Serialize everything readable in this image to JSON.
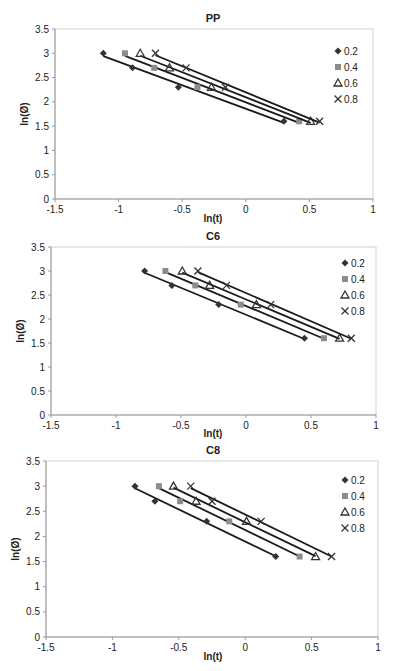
{
  "figure": {
    "width": 395,
    "height": 671
  },
  "chart_data": [
    {
      "type": "scatter",
      "title": "PP",
      "xlabel": "ln(t)",
      "ylabel": "ln(Ø)",
      "xlim": [
        -1.5,
        1
      ],
      "ylim": [
        0,
        3.5
      ],
      "xticks": [
        -1.5,
        -1,
        -0.5,
        0,
        0.5,
        1
      ],
      "yticks": [
        0,
        0.5,
        1,
        1.5,
        2,
        2.5,
        3,
        3.5
      ],
      "xtick_labels": [
        "-1.5",
        "-1",
        "-0.5",
        "0",
        "0.5",
        "1"
      ],
      "ytick_labels": [
        "0",
        "0.5",
        "1",
        "1.5",
        "2",
        "2.5",
        "3",
        "3.5"
      ],
      "grid": false,
      "legend_position": "right",
      "trendlines": "linear",
      "series": [
        {
          "name": "0.2",
          "marker": "diamond",
          "x": [
            -1.12,
            -0.89,
            -0.53,
            0.3
          ],
          "y": [
            3.0,
            2.7,
            2.3,
            1.6
          ]
        },
        {
          "name": "0.4",
          "marker": "square",
          "x": [
            -0.95,
            -0.72,
            -0.38,
            0.42
          ],
          "y": [
            3.0,
            2.7,
            2.3,
            1.6
          ]
        },
        {
          "name": "0.6",
          "marker": "triangle",
          "x": [
            -0.83,
            -0.6,
            -0.27,
            0.51
          ],
          "y": [
            3.0,
            2.7,
            2.3,
            1.6
          ]
        },
        {
          "name": "0.8",
          "marker": "x",
          "x": [
            -0.71,
            -0.47,
            -0.16,
            0.58
          ],
          "y": [
            3.0,
            2.7,
            2.3,
            1.6
          ]
        }
      ]
    },
    {
      "type": "scatter",
      "title": "C6",
      "xlabel": "ln(t)",
      "ylabel": "ln(Ø)",
      "xlim": [
        -1.5,
        1
      ],
      "ylim": [
        0,
        3.5
      ],
      "xticks": [
        -1.5,
        -1,
        -0.5,
        0,
        0.5,
        1
      ],
      "yticks": [
        0,
        0.5,
        1,
        1.5,
        2,
        2.5,
        3,
        3.5
      ],
      "xtick_labels": [
        "-1.5",
        "-1",
        "-0.5",
        "0",
        "0.5",
        "1"
      ],
      "ytick_labels": [
        "0",
        "0.5",
        "1",
        "1.5",
        "2",
        "2.5",
        "3",
        "3.5"
      ],
      "grid": false,
      "legend_position": "right",
      "trendlines": "linear",
      "series": [
        {
          "name": "0.2",
          "marker": "diamond",
          "x": [
            -0.78,
            -0.57,
            -0.21,
            0.45
          ],
          "y": [
            3.0,
            2.7,
            2.3,
            1.6
          ]
        },
        {
          "name": "0.4",
          "marker": "square",
          "x": [
            -0.62,
            -0.39,
            -0.04,
            0.6
          ],
          "y": [
            3.0,
            2.7,
            2.3,
            1.6
          ]
        },
        {
          "name": "0.6",
          "marker": "triangle",
          "x": [
            -0.49,
            -0.28,
            0.08,
            0.72
          ],
          "y": [
            3.0,
            2.7,
            2.3,
            1.6
          ]
        },
        {
          "name": "0.8",
          "marker": "x",
          "x": [
            -0.37,
            -0.15,
            0.19,
            0.81
          ],
          "y": [
            3.0,
            2.7,
            2.3,
            1.6
          ]
        }
      ]
    },
    {
      "type": "scatter",
      "title": "C8",
      "xlabel": "ln(t)",
      "ylabel": "ln(Ø)",
      "xlim": [
        -1.5,
        1
      ],
      "ylim": [
        0,
        3.5
      ],
      "xticks": [
        -1.5,
        -1,
        -0.5,
        0,
        0.5,
        1
      ],
      "yticks": [
        0,
        0.5,
        1,
        1.5,
        2,
        2.5,
        3,
        3.5
      ],
      "xtick_labels": [
        "-1.5",
        "-1",
        "-0.5",
        "0",
        "0.5",
        "1"
      ],
      "ytick_labels": [
        "0",
        "0.5",
        "1",
        "1.5",
        "2",
        "2.5",
        "3",
        "3.5"
      ],
      "grid": false,
      "legend_position": "right",
      "trendlines": "linear",
      "series": [
        {
          "name": "0.2",
          "marker": "diamond",
          "x": [
            -0.83,
            -0.68,
            -0.29,
            0.23
          ],
          "y": [
            3.0,
            2.7,
            2.3,
            1.6
          ]
        },
        {
          "name": "0.4",
          "marker": "square",
          "x": [
            -0.65,
            -0.49,
            -0.12,
            0.41
          ],
          "y": [
            3.0,
            2.7,
            2.3,
            1.6
          ]
        },
        {
          "name": "0.6",
          "marker": "triangle",
          "x": [
            -0.54,
            -0.37,
            0.01,
            0.53
          ],
          "y": [
            3.0,
            2.7,
            2.3,
            1.6
          ]
        },
        {
          "name": "0.8",
          "marker": "x",
          "x": [
            -0.41,
            -0.25,
            0.12,
            0.65
          ],
          "y": [
            3.0,
            2.7,
            2.3,
            1.6
          ]
        }
      ]
    }
  ],
  "style": {
    "marker_colors": {
      "diamond": "#333333",
      "square": "#8c8c8c",
      "triangle": "#333333",
      "x": "#333333"
    },
    "line_color": "#1a1a1a",
    "axis_color": "#999999",
    "frame_color": "#cfcfcf"
  }
}
